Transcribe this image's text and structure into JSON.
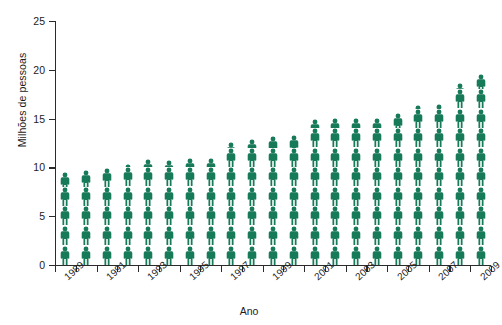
{
  "chart_data": {
    "type": "bar",
    "subtype": "pictogram",
    "title": "",
    "xlabel": "Ano",
    "ylabel": "Milhões de pessoas",
    "ylim": [
      0,
      25
    ],
    "yticks": [
      0,
      5,
      10,
      15,
      20,
      25
    ],
    "ytick_labels": [
      "0",
      "5",
      "10",
      "15",
      "20",
      "25"
    ],
    "grid": false,
    "legend": null,
    "series_color": "#177a58",
    "unit_per_icon": 2,
    "icon": "person-figure",
    "categories": [
      "1989",
      "1990",
      "1991",
      "1992",
      "1993",
      "1994",
      "1995",
      "1996",
      "1997",
      "1998",
      "1999",
      "2000",
      "2001",
      "2002",
      "2003",
      "2004",
      "2005",
      "2006",
      "2007",
      "2008",
      "2009"
    ],
    "xtick_labels": [
      "1989",
      "",
      "1991",
      "",
      "1993",
      "",
      "1995",
      "",
      "1997",
      "",
      "1999",
      "",
      "2001",
      "",
      "2003",
      "",
      "2005",
      "",
      "2007",
      "",
      "2009"
    ],
    "values": [
      9.5,
      9.7,
      9.9,
      10.3,
      10.9,
      10.8,
      11.0,
      11.0,
      12.6,
      12.9,
      13.2,
      13.3,
      15.0,
      15.1,
      15.1,
      15.1,
      15.6,
      16.4,
      16.5,
      18.6,
      19.6
    ],
    "value_labels": [
      "9.5",
      "9.7",
      "9.9",
      "10.3",
      "10.9",
      "10.8",
      "11.0",
      "11.0",
      "12.6",
      "12.9",
      "13.2",
      "13.3",
      "15.0",
      "15.1",
      "15.1",
      "15.1",
      "15.6",
      "16.4",
      "16.5",
      "18.6",
      "19.6"
    ]
  }
}
